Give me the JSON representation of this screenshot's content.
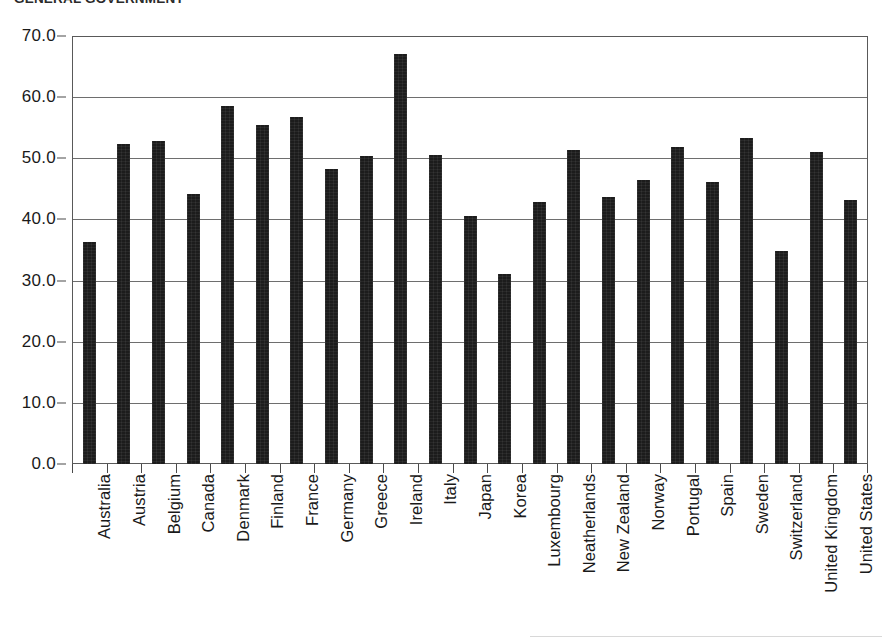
{
  "chart_data": {
    "type": "bar",
    "title": "GENERAL GOVERNMENT",
    "subtitle": "",
    "xlabel": "",
    "ylabel": "",
    "ylim": [
      0.0,
      70.0
    ],
    "ytick_step": 10.0,
    "ytick_labels": [
      "70.0",
      "60.0",
      "50.0",
      "40.0",
      "30.0",
      "20.0",
      "10.0",
      "0.0"
    ],
    "ytick_values": [
      70.0,
      60.0,
      50.0,
      40.0,
      30.0,
      20.0,
      10.0,
      0.0
    ],
    "grid": true,
    "grid_axis": "y",
    "legend": false,
    "legend_position": "none",
    "bar_color": "#1c1c1c",
    "frame_color": "#595959",
    "categories": [
      "Australia",
      "Austria",
      "Belgium",
      "Canada",
      "Denmark",
      "Finland",
      "France",
      "Germany",
      "Greece",
      "Ireland",
      "Italy",
      "Japan",
      "Korea",
      "Luxembourg",
      "Neatherlands",
      "New Zealand",
      "Norway",
      "Portugal",
      "Spain",
      "Sweden",
      "Switzerland",
      "United Kingdom",
      "United States"
    ],
    "values": [
      36.3,
      52.4,
      52.9,
      44.1,
      58.6,
      55.4,
      56.8,
      48.2,
      50.3,
      67.0,
      50.6,
      40.6,
      31.1,
      42.9,
      51.4,
      43.6,
      46.5,
      51.8,
      46.1,
      53.4,
      34.8,
      51.1,
      43.2
    ]
  }
}
